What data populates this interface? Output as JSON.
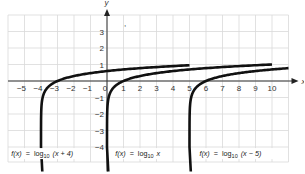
{
  "chart_data": {
    "type": "line",
    "title": "",
    "xlabel": "x",
    "ylabel": "y",
    "xlim": [
      -6,
      11
    ],
    "ylim": [
      -5,
      4
    ],
    "grid": true,
    "x_ticks": [
      -5,
      -4,
      -3,
      -2,
      -1,
      0,
      1,
      2,
      3,
      4,
      5,
      6,
      7,
      8,
      9,
      10
    ],
    "y_ticks": [
      3,
      2,
      1,
      -1,
      -2,
      -3,
      -4
    ],
    "series": [
      {
        "name": "f(x) = log10 (x + 4)",
        "func": "log10(x+4)",
        "shift": -4,
        "x_start": -3.9999,
        "x_end": 5,
        "points": [
          [
            -3.9999,
            -4
          ],
          [
            -3.9,
            -1
          ],
          [
            -3,
            0
          ],
          [
            -2,
            0.301
          ],
          [
            0,
            0.602
          ],
          [
            2,
            0.778
          ],
          [
            5,
            0.954
          ]
        ]
      },
      {
        "name": "f(x) = log10 x",
        "func": "log10(x)",
        "shift": 0,
        "x_start": 0.0001,
        "x_end": 10,
        "points": [
          [
            0.0001,
            -4
          ],
          [
            0.1,
            -1
          ],
          [
            1,
            0
          ],
          [
            2,
            0.301
          ],
          [
            5,
            0.699
          ],
          [
            10,
            1
          ]
        ]
      },
      {
        "name": "f(x) = log10 (x − 5)",
        "func": "log10(x-5)",
        "shift": 5,
        "x_start": 5.0001,
        "x_end": 11,
        "points": [
          [
            5.0001,
            -4
          ],
          [
            5.1,
            -1
          ],
          [
            6,
            0
          ],
          [
            7,
            0.301
          ],
          [
            10,
            0.699
          ],
          [
            11,
            0.778
          ]
        ]
      }
    ],
    "labels": [
      {
        "text_f": "f(x)",
        "eq": "=",
        "log": "log",
        "sub": "10",
        "arg": "(x + 4)",
        "x": -5.8,
        "y": -4.55
      },
      {
        "text_f": "f(x)",
        "eq": "=",
        "log": "log",
        "sub": "10",
        "arg": "x",
        "x": 0.5,
        "y": -4.55
      },
      {
        "text_f": "f(x)",
        "eq": "=",
        "log": "log",
        "sub": "10",
        "arg": "(x − 5)",
        "x": 5.6,
        "y": -4.55
      }
    ],
    "annotations": [
      ","
    ]
  }
}
